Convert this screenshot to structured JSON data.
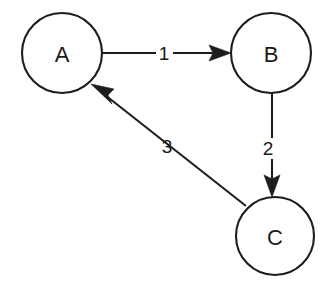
{
  "diagram": {
    "type": "directed-graph",
    "title": "",
    "background_color": "#ffffff",
    "stroke_color": "#1d1d1d",
    "nodes": [
      {
        "id": "A",
        "label": "A",
        "cx": 62,
        "cy": 53,
        "r": 40
      },
      {
        "id": "B",
        "label": "B",
        "cx": 271,
        "cy": 53,
        "r": 40
      },
      {
        "id": "C",
        "label": "C",
        "cx": 275,
        "cy": 236,
        "r": 39
      }
    ],
    "edges": [
      {
        "id": "edge-a-b",
        "from": "A",
        "to": "B",
        "label": "1",
        "label_x": 164,
        "label_y": 53,
        "direction": "right",
        "start_x": 102,
        "start_y": 53,
        "end_x": 231,
        "end_y": 53
      },
      {
        "id": "edge-b-c",
        "from": "B",
        "to": "C",
        "label": "2",
        "label_x": 268,
        "label_y": 148,
        "direction": "down",
        "start_x": 272,
        "start_y": 93,
        "end_x": 272,
        "end_y": 197
      },
      {
        "id": "edge-c-a",
        "from": "C",
        "to": "A",
        "label": "3",
        "label_x": 167,
        "label_y": 146,
        "direction": "up-left",
        "start_x": 246,
        "start_y": 206,
        "end_x": 91,
        "end_y": 84
      }
    ]
  }
}
